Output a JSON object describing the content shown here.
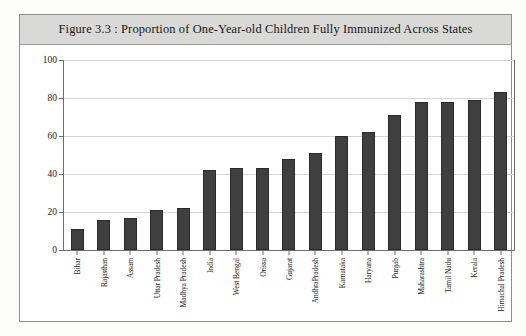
{
  "figure": {
    "title": "Figure 3.3 : Proportion of One-Year-old Children Fully Immunized Across States",
    "frame_color": "#8e8e8e",
    "title_band_color": "#d9d9d7",
    "bar_color": "#3f3f3f"
  },
  "chart_data": {
    "type": "bar",
    "title": "Figure 3.3 : Proportion of One-Year-old Children Fully Immunized Across States",
    "xlabel": "",
    "ylabel": "",
    "ylim": [
      0,
      100
    ],
    "yticks": [
      0,
      20,
      40,
      60,
      80,
      100
    ],
    "ytick_labels": [
      "0",
      "20",
      "40",
      "60",
      "80",
      "100"
    ],
    "grid": true,
    "legend": false,
    "categories": [
      "Bihar",
      "Rajasthan",
      "Assam",
      "Uttar Pradesh",
      "Madhya Pradesh",
      "India",
      "West Bengal",
      "Orissa",
      "Gujarat",
      "AndhraPradesh",
      "Karnataka",
      "Haryana",
      "Punjab",
      "Maharashtra",
      "Tamil Nadu",
      "Kerala",
      "Himachal Pradesh"
    ],
    "values": [
      11,
      16,
      17,
      21,
      22,
      42,
      43,
      43,
      48,
      51,
      60,
      62,
      71,
      78,
      78,
      79,
      83
    ]
  }
}
